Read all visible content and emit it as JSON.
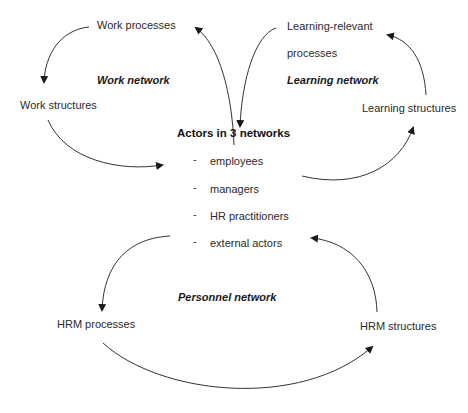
{
  "diagram": {
    "center": {
      "title": "Actors in 3 networks",
      "actors": [
        "employees",
        "managers",
        "HR practitioners",
        "external actors"
      ]
    },
    "networks": {
      "work": {
        "label": "Work network",
        "processes": "Work processes",
        "structures": "Work structures"
      },
      "learning": {
        "label": "Learning network",
        "processes_line1": "Learning-relevant",
        "processes_line2": "processes",
        "structures": "Learning structures"
      },
      "personnel": {
        "label": "Personnel network",
        "processes": "HRM processes",
        "structures": "HRM structures"
      }
    },
    "bullet_glyph": "-",
    "colors": {
      "line": "#333333",
      "background": "#ffffff"
    }
  }
}
